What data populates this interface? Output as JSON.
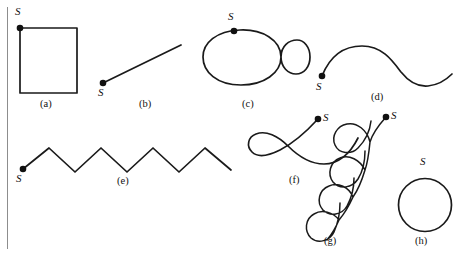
{
  "panel": {
    "title": "Curve figures with start points",
    "background_color": "#ffffff",
    "rule_color": "#8d8d8d",
    "stroke_color": "#1a1a1a",
    "dot_color": "#111111"
  },
  "figures": [
    {
      "key": "a",
      "caption": "(a)",
      "start_label": "S",
      "shape": "rectangle",
      "description": "closed rectangle traversed from top-left corner",
      "start_point": [
        20,
        28
      ],
      "caption_pos": [
        41,
        100
      ],
      "label_pos": [
        15,
        8
      ]
    },
    {
      "key": "b",
      "caption": "(b)",
      "start_label": "S",
      "shape": "line-segment",
      "description": "straight line rising to the right",
      "start_point": [
        103,
        83
      ],
      "end_point": [
        180,
        46
      ],
      "caption_pos": [
        140,
        100
      ],
      "label_pos": [
        98,
        88
      ]
    },
    {
      "key": "c",
      "caption": "(c)",
      "start_label": "S",
      "shape": "figure-eight",
      "description": "large left loop joined to small right loop at a crossing",
      "start_point": [
        234,
        31
      ],
      "caption_pos": [
        243,
        100
      ],
      "label_pos": [
        228,
        12
      ]
    },
    {
      "key": "d",
      "caption": "(d)",
      "start_label": "S",
      "shape": "sine-wave",
      "description": "single smooth wave, crest then trough",
      "start_point": [
        322,
        76
      ],
      "caption_pos": [
        372,
        96
      ],
      "label_pos": [
        316,
        82
      ]
    },
    {
      "key": "e",
      "caption": "(e)",
      "start_label": "S",
      "shape": "zigzag",
      "description": "sawtooth polyline with four peaks",
      "start_point": [
        23,
        169
      ],
      "caption_pos": [
        118,
        177
      ],
      "label_pos": [
        17,
        173
      ]
    },
    {
      "key": "f",
      "caption": "(f)",
      "start_label": "S",
      "shape": "loop-then-arc",
      "description": "curve descending from start through a left loop then sweeping right",
      "start_point": [
        318,
        119
      ],
      "caption_pos": [
        291,
        179
      ],
      "label_pos": [
        322,
        113
      ]
    },
    {
      "key": "g",
      "caption": "(g)",
      "start_label": "S",
      "shape": "coil",
      "description": "coil of four loops descending diagonally to the lower left",
      "start_point": [
        386,
        117
      ],
      "caption_pos": [
        326,
        238
      ],
      "label_pos": [
        390,
        111
      ]
    },
    {
      "key": "h",
      "caption": "(h)",
      "start_label": "S",
      "shape": "circle",
      "description": "closed circle with start point at the top",
      "start_point": [
        425,
        179
      ],
      "caption_pos": [
        416,
        238
      ],
      "label_pos": [
        420,
        157
      ]
    }
  ]
}
